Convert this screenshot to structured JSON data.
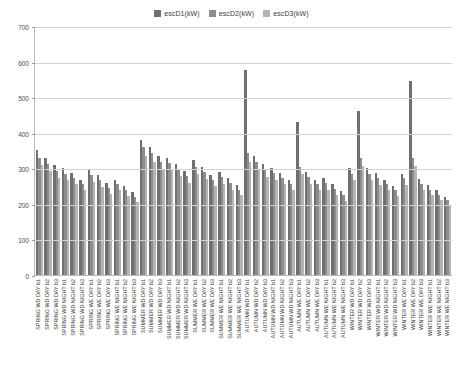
{
  "legend": {
    "position": "top-center",
    "items": [
      {
        "label": "escD1(kW)",
        "color": "#6f6f6f",
        "key": "escD1"
      },
      {
        "label": "escD2(kW)",
        "color": "#8d8d8d",
        "key": "escD2"
      },
      {
        "label": "escD3(kW)",
        "color": "#b4b4b4",
        "key": "escD3"
      }
    ]
  },
  "axes": {
    "y_ticks": [
      "0",
      "100",
      "200",
      "300",
      "400",
      "500",
      "600",
      "700"
    ],
    "y_min": 0,
    "y_max": 700,
    "y_step": 100
  },
  "chart_data": {
    "type": "bar",
    "title": "",
    "subtitle": "",
    "xlabel": "",
    "ylabel": "",
    "ylim": [
      0,
      700
    ],
    "grid": true,
    "legend_position": "top-center",
    "categories": [
      "SPRING WD DAY b1",
      "SPRING WD DAY b2",
      "SPRING WD DAY b3",
      "SPRING WD NIGHT b1",
      "SPRING WD NIGHT b2",
      "SPRING WD NIGHT b3",
      "SPRING WE DAY b1",
      "SPRING WE DAY b2",
      "SPRING WE DAY b3",
      "SPRING WE NIGHT b1",
      "SPRING WE NIGHT b2",
      "SPRING WE NIGHT b3",
      "SUMMER WD DAY b1",
      "SUMMER WD DAY b2",
      "SUMMER WD DAY b3",
      "SUMMER WD NIGHT b1",
      "SUMMER WD NIGHT b2",
      "SUMMER WD NIGHT b3",
      "SUMMER WE DAY b1",
      "SUMMER WE DAY b2",
      "SUMMER WE DAY b3",
      "SUMMER WE NIGHT b1",
      "SUMMER WE NIGHT b2",
      "SUMMER WE NIGHT b3",
      "AUTUMN WD DAY b1",
      "AUTUMN WD DAY b2",
      "AUTUMN WD DAY b3",
      "AUTUMN WD NIGHT b1",
      "AUTUMN WD NIGHT b2",
      "AUTUMN WD NIGHT b3",
      "AUTUMN WE DAY b1",
      "AUTUMN WE DAY b2",
      "AUTUMN WE DAY b3",
      "AUTUMN WE NIGHT b1",
      "AUTUMN WE NIGHT b2",
      "AUTUMN WE NIGHT b3",
      "WINTER WD DAY b1",
      "WINTER WD DAY b2",
      "WINTER WD DAY b3",
      "WINTER WD NIGHT b1",
      "WINTER WD NIGHT b2",
      "WINTER WD NIGHT b3",
      "WINTER WE DAY b1",
      "WINTER WE DAY b2",
      "WINTER WE DAY b3",
      "WINTER WE NIGHT b1",
      "WINTER WE NIGHT b2",
      "WINTER WE NIGHT b3"
    ],
    "series": [
      {
        "name": "escD1(kW)",
        "color": "#6f6f6f",
        "values": [
          352,
          330,
          308,
          300,
          286,
          268,
          298,
          282,
          258,
          268,
          250,
          232,
          380,
          360,
          335,
          330,
          312,
          292,
          322,
          305,
          282,
          290,
          272,
          252,
          575,
          335,
          312,
          300,
          288,
          268,
          430,
          290,
          268,
          272,
          255,
          236,
          300,
          462,
          300,
          286,
          268,
          250,
          285,
          545,
          270,
          252,
          238,
          220
        ]
      },
      {
        "name": "escD2(kW)",
        "color": "#8d8d8d",
        "values": [
          330,
          312,
          292,
          285,
          272,
          255,
          282,
          268,
          245,
          255,
          238,
          220,
          360,
          342,
          318,
          315,
          298,
          278,
          305,
          290,
          268,
          275,
          258,
          240,
          342,
          318,
          296,
          286,
          274,
          255,
          305,
          275,
          255,
          258,
          242,
          224,
          285,
          330,
          285,
          272,
          255,
          238,
          272,
          330,
          256,
          240,
          226,
          210
        ]
      },
      {
        "name": "escD3(kW)",
        "color": "#b4b4b4",
        "values": [
          308,
          292,
          272,
          268,
          255,
          238,
          262,
          248,
          228,
          238,
          222,
          206,
          335,
          318,
          296,
          294,
          278,
          260,
          284,
          270,
          250,
          256,
          240,
          224,
          318,
          296,
          276,
          268,
          256,
          238,
          284,
          256,
          238,
          240,
          226,
          209,
          266,
          306,
          266,
          254,
          238,
          222,
          254,
          306,
          239,
          224,
          211,
          196
        ]
      }
    ]
  }
}
